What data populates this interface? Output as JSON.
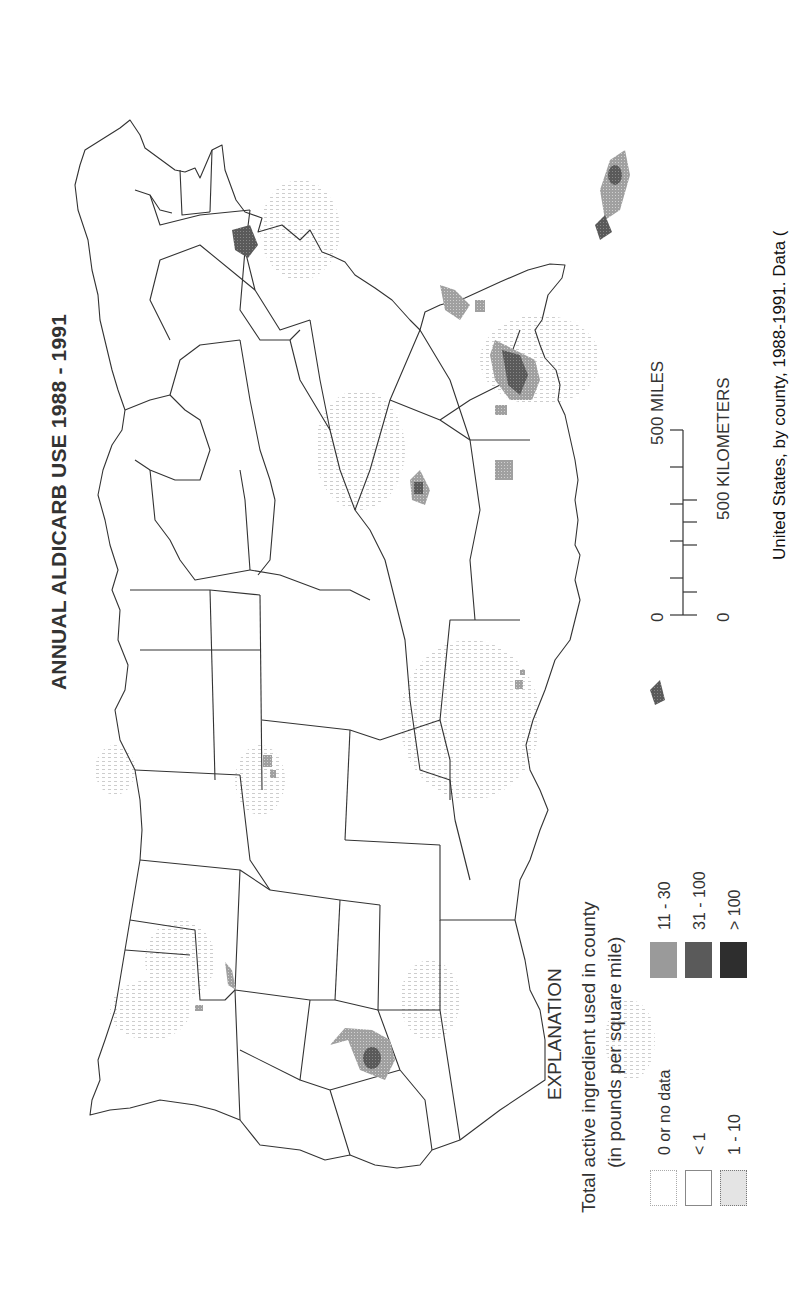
{
  "map": {
    "title": "ANNUAL ALDICARB USE 1988 - 1991",
    "orientation": "rotated 90 degrees counter-clockwise",
    "region": "Conterminous United States",
    "outline_color": "#333333"
  },
  "legend": {
    "heading": "EXPLANATION",
    "subtitle_line1": "Total active ingredient used in county",
    "subtitle_line2": "(in pounds per square mile)",
    "classes": [
      {
        "label": "0 or no data",
        "fill": "#ffffff",
        "border": "#aaaaaa"
      },
      {
        "label": "< 1",
        "fill": "#ffffff",
        "border": "#777777"
      },
      {
        "label": "1 - 10",
        "fill": "#e6e6e6",
        "border": "#777777"
      },
      {
        "label": "11 - 30",
        "fill": "#9a9a9a",
        "border": "#9a9a9a"
      },
      {
        "label": "31 - 100",
        "fill": "#5a5a5a",
        "border": "#5a5a5a"
      },
      {
        "label": "> 100",
        "fill": "#2e2e2e",
        "border": "#2e2e2e"
      }
    ]
  },
  "scale_bar": {
    "miles_zero": "0",
    "miles_label": "500 MILES",
    "km_zero": "0",
    "km_label": "500 KILOMETERS"
  },
  "caption": {
    "visible_text": "United States, by county, 1988-1991. Data ("
  },
  "hotspots": [
    {
      "area": "California Central Valley",
      "intensity": "11 - 30 with > 100 core"
    },
    {
      "area": "Florida",
      "intensity": "11 - 30 to > 100"
    },
    {
      "area": "Georgia / Alabama",
      "intensity": "31 - 100 to > 100"
    },
    {
      "area": "North Carolina / Virginia",
      "intensity": "11 - 30 to 31 - 100"
    },
    {
      "area": "Mississippi Delta",
      "intensity": "31 - 100 to > 100"
    },
    {
      "area": "Texas (High Plains)",
      "intensity": "11 - 30"
    },
    {
      "area": "Idaho",
      "intensity": "11 - 30"
    },
    {
      "area": "Nebraska / Colorado",
      "intensity": "11 - 30"
    },
    {
      "area": "Louisiana coast",
      "intensity": "31 - 100"
    },
    {
      "area": "Long Island / New York",
      "intensity": "> 100"
    }
  ]
}
